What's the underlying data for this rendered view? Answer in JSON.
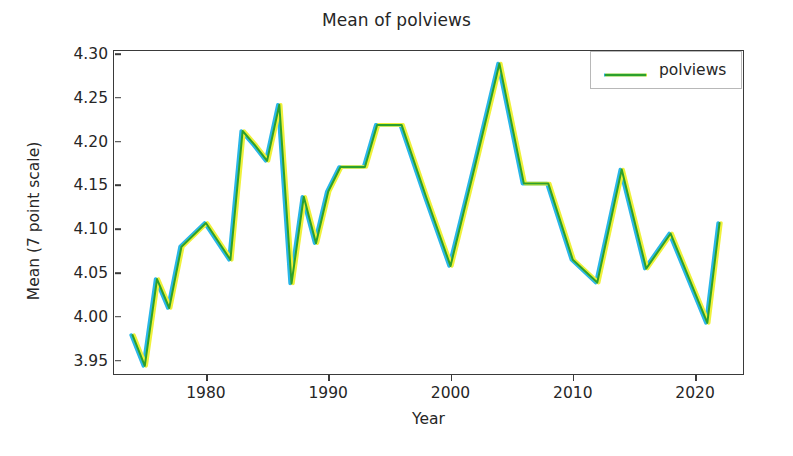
{
  "chart_data": {
    "type": "line",
    "title": "Mean of polviews",
    "xlabel": "Year",
    "ylabel": "Mean (7 point scale)",
    "xlim": [
      1972.4,
      2024.0
    ],
    "ylim": [
      3.9335,
      4.3045
    ],
    "grid": false,
    "legend_position": "upper right",
    "xticks": [
      1980,
      1990,
      2000,
      2010,
      2020
    ],
    "xtick_labels": [
      "1980",
      "1990",
      "2000",
      "2010",
      "2020"
    ],
    "yticks": [
      3.95,
      4.0,
      4.05,
      4.1,
      4.15,
      4.2,
      4.25,
      4.3
    ],
    "ytick_labels": [
      "3.95",
      "4.00",
      "4.05",
      "4.10",
      "4.15",
      "4.20",
      "4.25",
      "4.30"
    ],
    "series": [
      {
        "name": "polviews",
        "color": "#2ca02c",
        "x": [
          1974,
          1975,
          1976,
          1977,
          1978,
          1980,
          1982,
          1983,
          1984,
          1985,
          1986,
          1987,
          1988,
          1989,
          1990,
          1991,
          1993,
          1994,
          1996,
          1998,
          2000,
          2002,
          2004,
          2006,
          2008,
          2010,
          2012,
          2014,
          2016,
          2018,
          2021,
          2022
        ],
        "values": [
          3.979,
          3.944,
          4.043,
          4.01,
          4.08,
          4.107,
          4.065,
          4.212,
          4.196,
          4.178,
          4.242,
          4.038,
          4.137,
          4.084,
          4.143,
          4.171,
          4.171,
          4.219,
          4.219,
          4.137,
          4.058,
          4.172,
          4.289,
          4.152,
          4.152,
          4.065,
          4.039,
          4.168,
          4.055,
          4.095,
          3.993,
          4.107
        ]
      }
    ]
  },
  "legend": {
    "entries": [
      {
        "label": "polviews",
        "color": "#2ca02c"
      }
    ]
  },
  "colors": {
    "line": "#2ca02c",
    "line_fringe_left": "#29b6e8",
    "line_fringe_right": "#eff13a",
    "axis": "#3a3a3a",
    "text": "#262626",
    "background": "#ffffff",
    "legend_border": "#b8b8b8"
  }
}
